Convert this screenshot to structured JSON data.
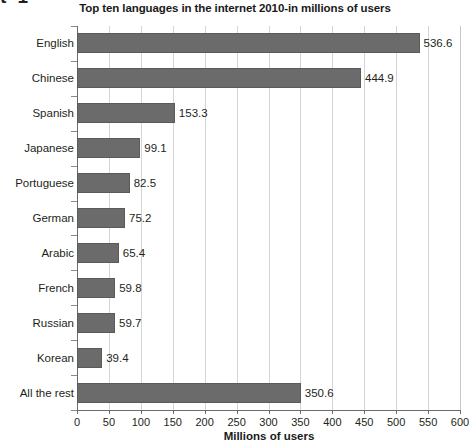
{
  "crop_artifact": {
    "text": "t 1"
  },
  "chart_data": {
    "type": "bar",
    "orientation": "horizontal",
    "title": "Top ten languages in the internet 2010-in millions of users",
    "xlabel": "Millions of users",
    "ylabel": "",
    "xlim": [
      0,
      600
    ],
    "xticks": [
      0,
      50,
      100,
      150,
      200,
      250,
      300,
      350,
      400,
      450,
      500,
      550,
      600
    ],
    "xtick_labels": [
      "0",
      "50",
      "100",
      "150",
      "200",
      "250",
      "300",
      "350",
      "400",
      "450",
      "500",
      "550",
      "600"
    ],
    "grid": true,
    "legend": null,
    "bar_color": "#6b6b6b",
    "categories": [
      "English",
      "Chinese",
      "Spanish",
      "Japanese",
      "Portuguese",
      "German",
      "Arabic",
      "French",
      "Russian",
      "Korean",
      "All the rest"
    ],
    "values": [
      536.6,
      444.9,
      153.3,
      99.1,
      82.5,
      75.2,
      65.4,
      59.8,
      59.7,
      39.4,
      350.6
    ],
    "value_labels": [
      "536.6",
      "444.9",
      "153.3",
      "99.1",
      "82.5",
      "75.2",
      "65.4",
      "59.8",
      "59.7",
      "39.4",
      "350.6"
    ]
  }
}
